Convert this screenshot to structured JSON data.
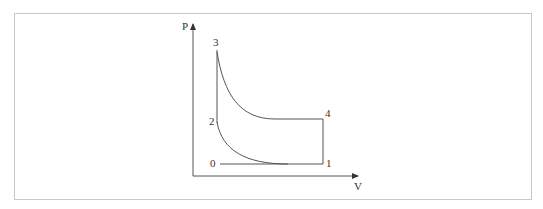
{
  "diagram": {
    "type": "pv-diagram",
    "axes": {
      "y_label": "P",
      "x_label": "V"
    },
    "points": [
      {
        "id": "0",
        "label": "0"
      },
      {
        "id": "1",
        "label": "1"
      },
      {
        "id": "2",
        "label": "2"
      },
      {
        "id": "3",
        "label": "3"
      },
      {
        "id": "4",
        "label": "4"
      }
    ],
    "colors": {
      "line": "#555555",
      "frame": "#c8c8c8",
      "text": "#333333"
    }
  }
}
